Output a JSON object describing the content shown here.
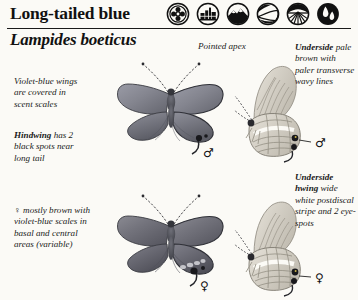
{
  "page": {
    "background_color": "#fbfaf6",
    "ink_color": "#1a1a1a"
  },
  "header": {
    "common_name": "Long-tailed blue",
    "scientific_name": "Lampides boeticus",
    "habitat_icons": [
      {
        "name": "flower-meadow-icon",
        "label": "flower"
      },
      {
        "name": "urban-buildings-icon",
        "label": "urban"
      },
      {
        "name": "mountain-icon",
        "label": "mountain"
      },
      {
        "name": "hillside-path-icon",
        "label": "hillside"
      },
      {
        "name": "farmland-rays-icon",
        "label": "farmland"
      },
      {
        "name": "wetland-water-icon",
        "label": "wetland"
      }
    ]
  },
  "annotations": {
    "upperside_forewing": {
      "lead": "",
      "text": "Violet-blue wings are covered in scent scales"
    },
    "hindwing": {
      "lead": "Hindwing",
      "text": "has 2 black spots near long tail"
    },
    "female_upperside": {
      "lead": "",
      "text": "♀ mostly brown with violet-blue scales in basal and central areas (variable)"
    },
    "pointed_apex": {
      "text": "Pointed apex"
    },
    "underside": {
      "lead": "Underside",
      "text": "pale brown with paler transverse wavy lines"
    },
    "underside_hwing": {
      "lead": "Underside hwing",
      "text": "wide white postdiscal stripe and 2 eye-spots"
    }
  },
  "specimens": [
    {
      "name": "male-upperside",
      "sex": "♂",
      "view": "upperside"
    },
    {
      "name": "male-underside",
      "sex": "♂",
      "view": "underside"
    },
    {
      "name": "female-upperside",
      "sex": "♀",
      "view": "upperside"
    },
    {
      "name": "female-underside",
      "sex": "♀",
      "view": "underside"
    }
  ]
}
